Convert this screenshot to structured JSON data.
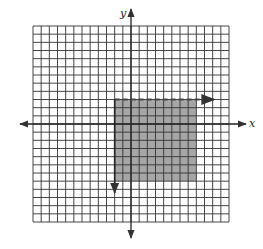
{
  "figure": {
    "type": "coordinate-plane-inequality-graph",
    "axes": {
      "x_label": "x",
      "y_label": "y"
    },
    "grid": {
      "min": -12,
      "max": 12,
      "cells_per_side": 24,
      "line_color": "#333333"
    },
    "shaded_region": {
      "description": "x >= -2 and y < 3",
      "left_boundary": {
        "x": -2,
        "style": "solid",
        "arrow": "down"
      },
      "top_boundary": {
        "y": 3,
        "style": "dashed",
        "arrow": "right"
      },
      "visible_extent": {
        "x_min": -2,
        "x_max": 8,
        "y_min": -7,
        "y_max": 3
      },
      "fill_color": "#a6a6a6"
    }
  }
}
